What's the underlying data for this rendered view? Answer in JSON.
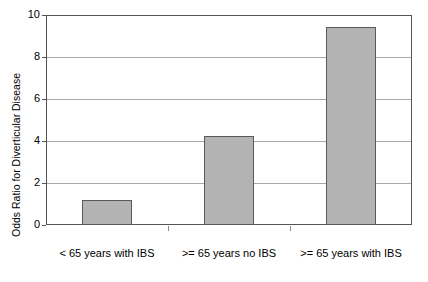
{
  "chart_data": {
    "type": "bar",
    "title": "",
    "subtitle": "",
    "xlabel": "",
    "ylabel": "Odds Ratio for Diverticular Disease",
    "categories": [
      "< 65 years with IBS",
      ">= 65 years no IBS",
      ">= 65 years with IBS"
    ],
    "values": [
      1.2,
      4.25,
      9.45
    ],
    "ylim": [
      0,
      10
    ],
    "yticks": [
      0,
      2,
      4,
      6,
      8,
      10
    ],
    "ytick_labels": [
      "0",
      "2",
      "4",
      "6",
      "8",
      "10"
    ],
    "grid": "horizontal",
    "legend": "none",
    "series": [
      {
        "name": "Odds Ratio",
        "values": [
          1.2,
          4.25,
          9.45
        ]
      }
    ],
    "colors": {
      "bar_fill": "#b3b3b3",
      "bar_border": "#5a5a5a",
      "gridline": "#a8a8a8",
      "frame": "#555555",
      "background": "#ffffff",
      "text": "#000000"
    }
  }
}
